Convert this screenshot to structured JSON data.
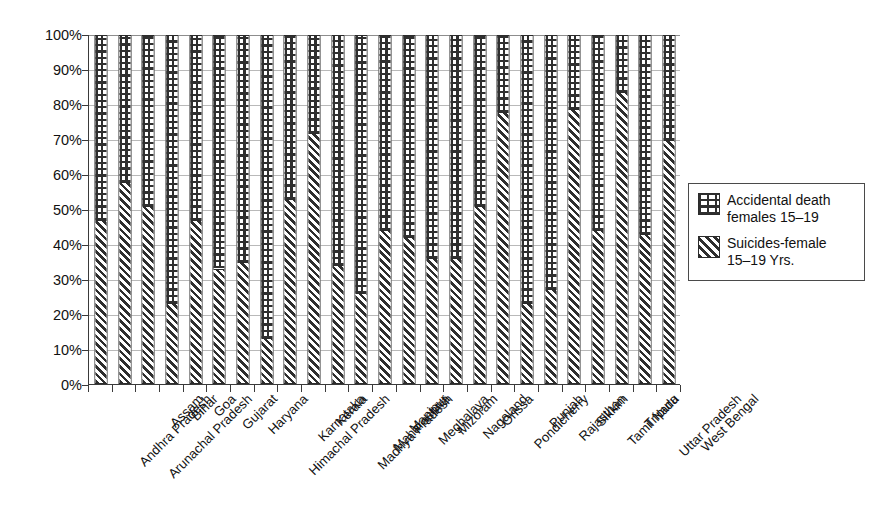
{
  "chart_data": {
    "type": "bar",
    "subtype": "100% stacked column",
    "title": "",
    "xlabel": "",
    "ylabel": "",
    "ylim": [
      0,
      100
    ],
    "ytick_labels": [
      "100%",
      "90%",
      "80%",
      "70%",
      "60%",
      "50%",
      "40%",
      "30%",
      "20%",
      "10%",
      "0%"
    ],
    "ytick_values": [
      100,
      90,
      80,
      70,
      60,
      50,
      40,
      30,
      20,
      10,
      0
    ],
    "grid": true,
    "legend_position": "right",
    "categories": [
      "Andhra Pradesh",
      "Arunachal Pradesh",
      "Assam",
      "Bihar",
      "Goa",
      "Gujarat",
      "Haryana",
      "Himachal Pradesh",
      "Karnataka",
      "Kerala",
      "Madhya Pradesh",
      "Maharashtra",
      "Manipur",
      "Meghalaya",
      "Mizoram",
      "Nagaland",
      "Orissa",
      "Pondicherry",
      "Punjab",
      "Rajasthan",
      "Sikkim",
      "Tamil Nadu",
      "Tripura",
      "Uttar Pradesh",
      "West Bengal"
    ],
    "series": [
      {
        "name": "Suicides-female 15–19 Yrs.",
        "pattern": "diagonal-hatch",
        "values": [
          47,
          58,
          51,
          23,
          47,
          33,
          35,
          13,
          53,
          72,
          34,
          26,
          44,
          42,
          36,
          36,
          51,
          78,
          23,
          27,
          79,
          44,
          84,
          43,
          70
        ]
      },
      {
        "name": "Accidental death females 15–19",
        "pattern": "horizontal-brick",
        "values": [
          53,
          42,
          49,
          77,
          53,
          67,
          65,
          87,
          47,
          28,
          66,
          74,
          56,
          58,
          64,
          64,
          49,
          22,
          77,
          73,
          21,
          56,
          16,
          57,
          30
        ]
      }
    ]
  },
  "legend": {
    "items": [
      {
        "label": "Accidental death\nfemales 15–19",
        "swatch": "accident-pattern-swatch"
      },
      {
        "label": "Suicides-female\n15–19 Yrs.",
        "swatch": "suicide-pattern-swatch"
      }
    ]
  },
  "colors": {
    "ink": "#2b2b2b",
    "grid": "#b9b9b9",
    "axis": "#3a3a3a",
    "background": "#ffffff"
  }
}
